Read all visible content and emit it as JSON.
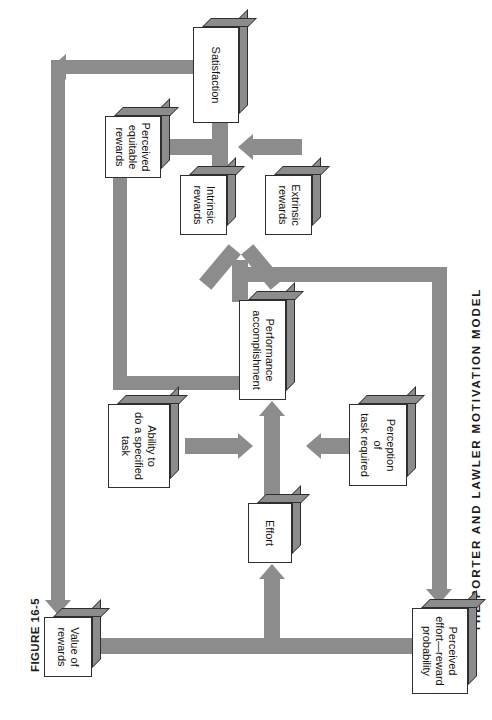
{
  "figure": {
    "number": "FIGURE 16-5",
    "caption": "THE PORTER AND LAWLER MOTIVATION MODEL"
  },
  "colors": {
    "arrow": "#8c8c8c",
    "box_fill": "#ffffff",
    "box_stroke": "#2e2e2e",
    "text": "#111111",
    "page_background": "#ffffff"
  },
  "diagram": {
    "type": "flow-diagram",
    "orientation": "rotated-90-clockwise",
    "nodes": [
      {
        "id": "value-of-rewards",
        "label": "Value of\nrewards",
        "line1": "Value of",
        "line2": "rewards",
        "line3": ""
      },
      {
        "id": "perceived-effort-reward-probability",
        "label": "Perceived\neffort—reward\nprobability",
        "line1": "Perceived",
        "line2": "effort—reward",
        "line3": "probability"
      },
      {
        "id": "effort",
        "label": "Effort",
        "line1": "Effort",
        "line2": "",
        "line3": ""
      },
      {
        "id": "ability-to-do-a-specified-task",
        "label": "Ability to\ndo a specified\ntask",
        "line1": "Ability to",
        "line2": "do a specified",
        "line3": "task"
      },
      {
        "id": "perception-of-task-required",
        "label": "Perception\nof\ntask required",
        "line1": "Perception",
        "line2": "of",
        "line3": "task required"
      },
      {
        "id": "performance-accomplishment",
        "label": "Performance\naccomplishment",
        "line1": "Performance",
        "line2": "accomplishment",
        "line3": ""
      },
      {
        "id": "intrinsic-rewards",
        "label": "Intrinsic\nrewards",
        "line1": "Intrinsic",
        "line2": "rewards",
        "line3": ""
      },
      {
        "id": "extrinsic-rewards",
        "label": "Extrinsic\nrewards",
        "line1": "Extrinsic",
        "line2": "rewards",
        "line3": ""
      },
      {
        "id": "perceived-equitable-rewards",
        "label": "Perceived\nequitable\nrewards",
        "line1": "Perceived",
        "line2": "equitable",
        "line3": "rewards"
      },
      {
        "id": "satisfaction",
        "label": "Satisfaction",
        "line1": "Satisfaction",
        "line2": "",
        "line3": ""
      }
    ],
    "edges": [
      {
        "from": "value-of-rewards",
        "to": "effort"
      },
      {
        "from": "perceived-effort-reward-probability",
        "to": "effort"
      },
      {
        "from": "effort",
        "to": "performance-accomplishment"
      },
      {
        "from": "ability-to-do-a-specified-task",
        "to": "performance-accomplishment"
      },
      {
        "from": "perception-of-task-required",
        "to": "performance-accomplishment"
      },
      {
        "from": "performance-accomplishment",
        "to": "intrinsic-rewards"
      },
      {
        "from": "performance-accomplishment",
        "to": "extrinsic-rewards"
      },
      {
        "from": "performance-accomplishment",
        "to": "perceived-equitable-rewards"
      },
      {
        "from": "performance-accomplishment",
        "to": "perceived-effort-reward-probability"
      },
      {
        "from": "intrinsic-rewards",
        "to": "satisfaction"
      },
      {
        "from": "extrinsic-rewards",
        "to": "satisfaction"
      },
      {
        "from": "perceived-equitable-rewards",
        "to": "satisfaction"
      },
      {
        "from": "satisfaction",
        "to": "value-of-rewards"
      }
    ]
  }
}
